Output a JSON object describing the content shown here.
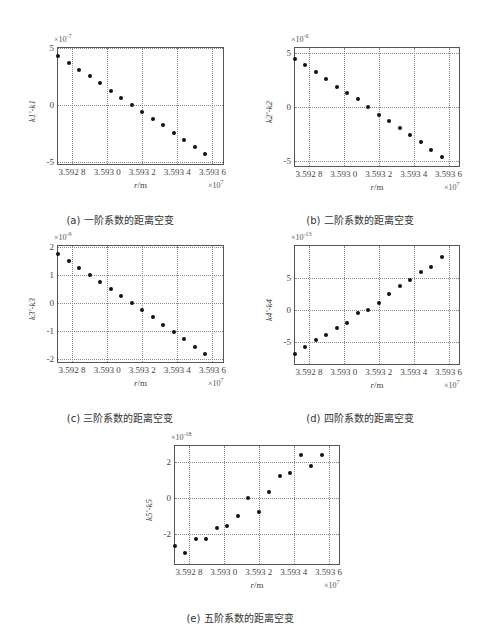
{
  "chart_data": [
    {
      "type": "scatter",
      "id": "a",
      "caption": "(a) 一阶系数的距离空变",
      "xlabel": "r/m",
      "ylabel": "k1'-k1",
      "x_multiplier": "×10^7",
      "y_multiplier": "×10^-7",
      "xlim": [
        3.59272,
        3.59366
      ],
      "ylim": [
        -5.2,
        5
      ],
      "xticks": [
        3.5928,
        3.593,
        3.5932,
        3.5934,
        3.5936
      ],
      "xtick_labels": [
        "3.592 8",
        "3.593 0",
        "3.593 2",
        "3.593 4",
        "3.593 6"
      ],
      "yticks": [
        -5,
        0,
        5
      ],
      "ytick_labels": [
        "-5",
        "0",
        "5"
      ],
      "grid": true,
      "x": [
        3.59272,
        3.59278,
        3.59284,
        3.5929,
        3.59296,
        3.59302,
        3.59308,
        3.59314,
        3.5932,
        3.59326,
        3.59332,
        3.59338,
        3.59344,
        3.5935,
        3.59356
      ],
      "values": [
        4.3,
        3.7,
        3.1,
        2.5,
        1.9,
        1.2,
        0.6,
        0.0,
        -0.6,
        -1.2,
        -1.8,
        -2.5,
        -3.1,
        -3.7,
        -4.3
      ]
    },
    {
      "type": "scatter",
      "id": "b",
      "caption": "(b) 二阶系数的距离空变",
      "xlabel": "r/m",
      "ylabel": "k2'-k2",
      "x_multiplier": "×10^7",
      "y_multiplier": "×10^-6",
      "xlim": [
        3.59272,
        3.59366
      ],
      "ylim": [
        -5.5,
        5.5
      ],
      "xticks": [
        3.5928,
        3.593,
        3.5932,
        3.5934,
        3.5936
      ],
      "xtick_labels": [
        "3.592 8",
        "3.593 0",
        "3.593 2",
        "3.593 4",
        "3.593 6"
      ],
      "yticks": [
        -5,
        0,
        5
      ],
      "ytick_labels": [
        "-5",
        "0",
        "5"
      ],
      "grid": true,
      "x": [
        3.59272,
        3.59278,
        3.59284,
        3.5929,
        3.59296,
        3.59302,
        3.59308,
        3.59314,
        3.5932,
        3.59326,
        3.59332,
        3.59338,
        3.59344,
        3.5935,
        3.59356
      ],
      "values": [
        4.5,
        3.9,
        3.3,
        2.6,
        1.9,
        1.3,
        0.7,
        0.0,
        -0.7,
        -1.3,
        -2.0,
        -2.6,
        -3.3,
        -4.0,
        -4.7
      ]
    },
    {
      "type": "scatter",
      "id": "c",
      "caption": "(c) 三阶系数的距离空变",
      "xlabel": "r/m",
      "ylabel": "k3'-k3",
      "x_multiplier": "×10^7",
      "y_multiplier": "×10^-9",
      "xlim": [
        3.59272,
        3.59366
      ],
      "ylim": [
        -2.1,
        2.05
      ],
      "xticks": [
        3.5928,
        3.593,
        3.5932,
        3.5934,
        3.5936
      ],
      "xtick_labels": [
        "3.592 8",
        "3.593 0",
        "3.593 2",
        "3.593 4",
        "3.593 6"
      ],
      "yticks": [
        -2,
        -1,
        0,
        1,
        2
      ],
      "ytick_labels": [
        "-2",
        "-1",
        "0",
        "1",
        "2"
      ],
      "grid": true,
      "x": [
        3.59272,
        3.59278,
        3.59284,
        3.5929,
        3.59296,
        3.59302,
        3.59308,
        3.59314,
        3.5932,
        3.59326,
        3.59332,
        3.59338,
        3.59344,
        3.5935,
        3.59356
      ],
      "values": [
        1.75,
        1.5,
        1.25,
        1.0,
        0.75,
        0.5,
        0.25,
        0.0,
        -0.25,
        -0.5,
        -0.78,
        -1.02,
        -1.28,
        -1.55,
        -1.82
      ]
    },
    {
      "type": "scatter",
      "id": "d",
      "caption": "(d) 四阶系数的距离空变",
      "xlabel": "r/m",
      "ylabel": "k4'-k4",
      "x_multiplier": "×10^7",
      "y_multiplier": "×10^-13",
      "xlim": [
        3.59272,
        3.59366
      ],
      "ylim": [
        -8.5,
        10
      ],
      "xticks": [
        3.5928,
        3.593,
        3.5932,
        3.5934,
        3.5936
      ],
      "xtick_labels": [
        "3.592 8",
        "3.593 0",
        "3.593 2",
        "3.593 4",
        "3.593 6"
      ],
      "yticks": [
        -5,
        0,
        5
      ],
      "ytick_labels": [
        "-5",
        "0",
        "5"
      ],
      "grid": true,
      "x": [
        3.59272,
        3.59278,
        3.59284,
        3.5929,
        3.59296,
        3.59302,
        3.59308,
        3.59314,
        3.5932,
        3.59326,
        3.59332,
        3.59338,
        3.59344,
        3.5935,
        3.59356
      ],
      "values": [
        -6.9,
        -5.9,
        -4.7,
        -3.9,
        -2.8,
        -2.0,
        -0.5,
        0.0,
        1.0,
        2.4,
        3.7,
        4.6,
        5.9,
        6.7,
        8.3
      ]
    },
    {
      "type": "scatter",
      "id": "e",
      "caption": "(e) 五阶系数的距离空变",
      "xlabel": "r/m",
      "ylabel": "k5'-k5",
      "x_multiplier": "×10^7",
      "y_multiplier": "×10^-18",
      "xlim": [
        3.59272,
        3.59366
      ],
      "ylim": [
        -3.7,
        2.9
      ],
      "xticks": [
        3.5928,
        3.593,
        3.5932,
        3.5934,
        3.5936
      ],
      "xtick_labels": [
        "3.592 8",
        "3.593 0",
        "3.593 2",
        "3.593 4",
        "3.593 6"
      ],
      "yticks": [
        -2,
        0,
        2
      ],
      "ytick_labels": [
        "-2",
        "0",
        "2"
      ],
      "grid": true,
      "x": [
        3.59272,
        3.59278,
        3.59284,
        3.5929,
        3.59296,
        3.59302,
        3.59308,
        3.59314,
        3.5932,
        3.59326,
        3.59332,
        3.59338,
        3.59344,
        3.5935,
        3.59356
      ],
      "values": [
        -2.7,
        -3.1,
        -2.3,
        -2.3,
        -1.7,
        -1.6,
        -1.0,
        0.0,
        -0.8,
        0.3,
        1.2,
        1.4,
        2.4,
        1.8,
        2.4
      ]
    }
  ],
  "panels": [
    {
      "caption": "(a) 一阶系数的距离空变",
      "ylabel": "k1'-k1",
      "yexp": "-7"
    },
    {
      "caption": "(b) 二阶系数的距离空变",
      "ylabel": "k2'-k2",
      "yexp": "-6"
    },
    {
      "caption": "(c) 三阶系数的距离空变",
      "ylabel": "k3'-k3",
      "yexp": "-9"
    },
    {
      "caption": "(d) 四阶系数的距离空变",
      "ylabel": "k4'-k4",
      "yexp": "-13"
    },
    {
      "caption": "(e) 五阶系数的距离空变",
      "ylabel": "k5'-k5",
      "yexp": "-18"
    }
  ],
  "common": {
    "xlabel_r": "r",
    "xlabel_unit": "/m",
    "x_times": "×10",
    "x_exp": "7",
    "y_times": "×10"
  }
}
